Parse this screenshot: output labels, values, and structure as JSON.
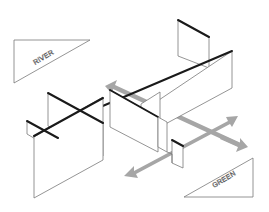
{
  "diagram": {
    "type": "isometric-wall-layout",
    "background": "#ffffff",
    "line_color": "#7a7a7a",
    "heavy_line_color": "#1a1a1a",
    "arrow_color": "#a6a6a6",
    "labels": {
      "river": "RIVER",
      "green": "GREEN"
    },
    "icons": {
      "river_marker": "triangle-marker",
      "green_marker": "triangle-marker",
      "direction_arrows": "double-headed-arrow"
    }
  }
}
